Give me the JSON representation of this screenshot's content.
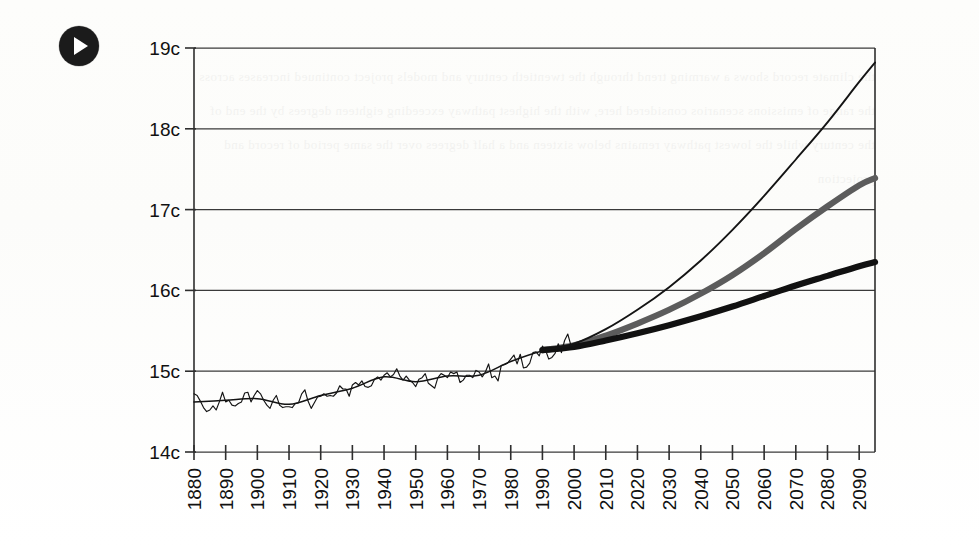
{
  "figure": {
    "media_badge": {
      "icon": "play-icon",
      "label": "Play"
    },
    "background_color": "#fdfdfc"
  },
  "chart_data": {
    "type": "line",
    "title": "",
    "subtitle": "",
    "xlabel": "",
    "ylabel": "",
    "grid": true,
    "legend_position": "none",
    "xlim": [
      1880,
      2095
    ],
    "ylim": [
      14,
      19
    ],
    "y_tick_labels": [
      "19c",
      "18c",
      "17c",
      "16c",
      "15c",
      "14c"
    ],
    "y_tick_values": [
      19,
      18,
      17,
      16,
      15,
      14
    ],
    "x_tick_labels": [
      "1880",
      "1890",
      "1900",
      "1910",
      "1920",
      "1930",
      "1940",
      "1950",
      "1960",
      "1970",
      "1980",
      "1990",
      "2000",
      "2010",
      "2020",
      "2030",
      "2040",
      "2050",
      "2060",
      "2070",
      "2080",
      "2090"
    ],
    "x_tick_values": [
      1880,
      1890,
      1900,
      1910,
      1920,
      1930,
      1940,
      1950,
      1960,
      1970,
      1980,
      1990,
      2000,
      2010,
      2020,
      2030,
      2040,
      2050,
      2060,
      2070,
      2080,
      2090
    ],
    "units": "degrees Celsius",
    "series": [
      {
        "name": "Observed annual mean temperature",
        "style": "thin-jagged",
        "color": "#141414",
        "x": [
          1880,
          1881,
          1882,
          1883,
          1884,
          1885,
          1886,
          1887,
          1888,
          1889,
          1890,
          1891,
          1892,
          1893,
          1894,
          1895,
          1896,
          1897,
          1898,
          1899,
          1900,
          1901,
          1902,
          1903,
          1904,
          1905,
          1906,
          1907,
          1908,
          1909,
          1910,
          1911,
          1912,
          1913,
          1914,
          1915,
          1916,
          1917,
          1918,
          1919,
          1920,
          1921,
          1922,
          1923,
          1924,
          1925,
          1926,
          1927,
          1928,
          1929,
          1930,
          1931,
          1932,
          1933,
          1934,
          1935,
          1936,
          1937,
          1938,
          1939,
          1940,
          1941,
          1942,
          1943,
          1944,
          1945,
          1946,
          1947,
          1948,
          1949,
          1950,
          1951,
          1952,
          1953,
          1954,
          1955,
          1956,
          1957,
          1958,
          1959,
          1960,
          1961,
          1962,
          1963,
          1964,
          1965,
          1966,
          1967,
          1968,
          1969,
          1970,
          1971,
          1972,
          1973,
          1974,
          1975,
          1976,
          1977,
          1978,
          1979,
          1980,
          1981,
          1982,
          1983,
          1984,
          1985,
          1986,
          1987,
          1988,
          1989,
          1990,
          1991,
          1992,
          1993,
          1994,
          1995,
          1996,
          1997,
          1998,
          1999,
          2000
        ],
        "y": [
          14.72,
          14.7,
          14.63,
          14.55,
          14.5,
          14.52,
          14.57,
          14.52,
          14.62,
          14.74,
          14.62,
          14.64,
          14.58,
          14.57,
          14.6,
          14.62,
          14.73,
          14.74,
          14.62,
          14.7,
          14.76,
          14.72,
          14.64,
          14.58,
          14.54,
          14.64,
          14.7,
          14.58,
          14.55,
          14.56,
          14.56,
          14.55,
          14.6,
          14.61,
          14.72,
          14.77,
          14.63,
          14.54,
          14.61,
          14.68,
          14.69,
          14.72,
          14.69,
          14.7,
          14.69,
          14.73,
          14.82,
          14.78,
          14.78,
          14.69,
          14.83,
          14.86,
          14.83,
          14.88,
          14.81,
          14.8,
          14.82,
          14.9,
          14.93,
          14.89,
          14.95,
          14.98,
          14.93,
          14.96,
          15.03,
          14.94,
          14.89,
          14.94,
          14.89,
          14.86,
          14.81,
          14.9,
          14.92,
          14.97,
          14.85,
          14.82,
          14.79,
          14.92,
          14.97,
          14.95,
          14.92,
          14.99,
          14.97,
          14.99,
          14.86,
          14.89,
          14.95,
          14.95,
          14.92,
          15.01,
          14.99,
          14.93,
          14.99,
          15.09,
          14.92,
          14.94,
          14.88,
          15.07,
          15.08,
          15.1,
          15.15,
          15.2,
          15.09,
          15.21,
          15.04,
          15.05,
          15.1,
          15.23,
          15.24,
          15.19,
          15.31,
          15.26,
          15.15,
          15.17,
          15.22,
          15.34,
          15.23,
          15.38,
          15.46,
          15.32,
          15.3
        ]
      },
      {
        "name": "Smoothed observed trend",
        "style": "thin-smooth",
        "color": "#141414",
        "x": [
          1880,
          1890,
          1900,
          1910,
          1920,
          1930,
          1940,
          1950,
          1960,
          1970,
          1980,
          1990,
          2000
        ],
        "y": [
          14.62,
          14.64,
          14.66,
          14.59,
          14.7,
          14.79,
          14.93,
          14.87,
          14.94,
          14.95,
          15.12,
          15.25,
          15.32
        ]
      },
      {
        "name": "High emissions projection",
        "style": "thin",
        "color": "#141414",
        "x": [
          1990,
          2000,
          2010,
          2020,
          2030,
          2040,
          2050,
          2060,
          2070,
          2080,
          2090,
          2095
        ],
        "y": [
          15.26,
          15.34,
          15.52,
          15.76,
          16.04,
          16.37,
          16.75,
          17.17,
          17.62,
          18.08,
          18.58,
          18.82
        ]
      },
      {
        "name": "Medium emissions projection",
        "style": "thick-gray",
        "color": "#5c5c5c",
        "x": [
          1990,
          2000,
          2010,
          2020,
          2030,
          2040,
          2050,
          2060,
          2070,
          2080,
          2090,
          2095
        ],
        "y": [
          15.26,
          15.32,
          15.44,
          15.59,
          15.76,
          15.96,
          16.19,
          16.46,
          16.76,
          17.04,
          17.3,
          17.39
        ]
      },
      {
        "name": "Low emissions projection",
        "style": "thick-black",
        "color": "#111111",
        "x": [
          1990,
          2000,
          2010,
          2020,
          2030,
          2040,
          2050,
          2060,
          2070,
          2080,
          2090,
          2095
        ],
        "y": [
          15.26,
          15.3,
          15.38,
          15.47,
          15.57,
          15.68,
          15.8,
          15.93,
          16.06,
          16.18,
          16.3,
          16.35
        ]
      }
    ],
    "annotations": []
  },
  "ghost": {
    "bleed_text": "the climate record shows a warming trend through the twentieth century and models project continued increases across the range of emissions scenarios considered here, with the highest pathway exceeding eighteen degrees by the end of the century while the lowest pathway remains below sixteen and a half degrees over the same period of record and projection"
  }
}
